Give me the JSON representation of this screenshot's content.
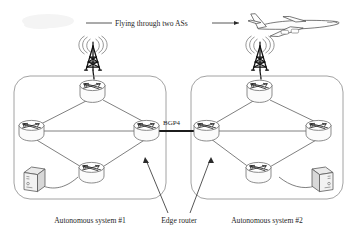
{
  "figure": {
    "title_annotation": "Flying through two ASs",
    "bgp_link_label": "BGP4",
    "edge_router_label": "Edge router",
    "as_left_label": "Autonomous system #1",
    "as_right_label": "Autonomous system #2",
    "background_color": "#ffffff",
    "line_color": "#555555",
    "bgp_line_color": "#1c1c1c",
    "boundary_color": "#8c8c8c"
  },
  "icons": {
    "plane": "airplane-icon",
    "tower_left": "radio-tower-icon",
    "tower_right": "radio-tower-icon",
    "router": "router-icon",
    "host": "server-host-icon",
    "arrow": "arrow-icon"
  },
  "topology": {
    "autonomous_systems": [
      {
        "name": "Autonomous system #1",
        "nodes": [
          {
            "id": "as1-top",
            "type": "router",
            "role": "core"
          },
          {
            "id": "as1-left",
            "type": "router",
            "role": "core"
          },
          {
            "id": "as1-right",
            "type": "router",
            "role": "edge"
          },
          {
            "id": "as1-bottom",
            "type": "router",
            "role": "core"
          },
          {
            "id": "as1-host",
            "type": "host",
            "role": "host"
          }
        ],
        "links": [
          [
            "as1-top",
            "as1-left"
          ],
          [
            "as1-top",
            "as1-right"
          ],
          [
            "as1-left",
            "as1-right"
          ],
          [
            "as1-left",
            "as1-bottom"
          ],
          [
            "as1-bottom",
            "as1-right"
          ],
          [
            "as1-host",
            "as1-bottom"
          ],
          [
            "as1-top",
            "tower-left"
          ]
        ]
      },
      {
        "name": "Autonomous system #2",
        "nodes": [
          {
            "id": "as2-top",
            "type": "router",
            "role": "core"
          },
          {
            "id": "as2-left",
            "type": "router",
            "role": "edge"
          },
          {
            "id": "as2-right",
            "type": "router",
            "role": "core"
          },
          {
            "id": "as2-bottom",
            "type": "router",
            "role": "core"
          },
          {
            "id": "as2-host",
            "type": "host",
            "role": "host"
          }
        ],
        "links": [
          [
            "as2-top",
            "as2-left"
          ],
          [
            "as2-top",
            "as2-right"
          ],
          [
            "as2-left",
            "as2-right"
          ],
          [
            "as2-left",
            "as2-bottom"
          ],
          [
            "as2-bottom",
            "as2-right"
          ],
          [
            "as2-host",
            "as2-bottom"
          ],
          [
            "as2-top",
            "tower-right"
          ]
        ]
      }
    ],
    "inter_as_link": {
      "from": "as1-right",
      "to": "as2-left",
      "protocol": "BGP4"
    },
    "callouts": [
      {
        "label": "Edge router",
        "targets": [
          "as1-right",
          "as2-left"
        ]
      }
    ]
  }
}
